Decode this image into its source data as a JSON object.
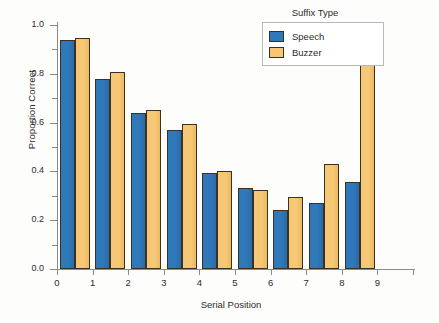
{
  "chart_data": {
    "type": "bar",
    "title": "",
    "xlabel": "Serial Position",
    "ylabel": "Proportion Correct",
    "categories": [
      "1",
      "2",
      "3",
      "4",
      "5",
      "6",
      "7",
      "8",
      "9"
    ],
    "series": [
      {
        "name": "Speech",
        "color": "#2f78ba",
        "values": [
          0.94,
          0.78,
          0.64,
          0.57,
          0.395,
          0.332,
          0.24,
          0.27,
          0.357
        ]
      },
      {
        "name": "Buzzer",
        "color": "#f6c876",
        "values": [
          0.947,
          0.808,
          0.653,
          0.594,
          0.402,
          0.325,
          0.295,
          0.43,
          0.906
        ]
      }
    ],
    "ylim": [
      0.0,
      1.0
    ],
    "ytick_labels": [
      "0.0",
      "0.2",
      "0.4",
      "0.6",
      "0.8",
      "1.0"
    ],
    "ytick_values": [
      0.0,
      0.2,
      0.4,
      0.6,
      0.8,
      1.0
    ],
    "yminor_values": [
      0.1,
      0.3,
      0.5,
      0.7,
      0.9
    ],
    "xtick_labels": [
      "0",
      "1",
      "2",
      "3",
      "4",
      "5",
      "6",
      "7",
      "8",
      "9"
    ],
    "grid": false,
    "legend_position": "top-right"
  },
  "legend": {
    "title": "Suffix Type",
    "entries": [
      {
        "label": "Speech",
        "color": "#2f78ba"
      },
      {
        "label": "Buzzer",
        "color": "#f6c876"
      }
    ]
  },
  "axes": {
    "origin_label": "0"
  }
}
